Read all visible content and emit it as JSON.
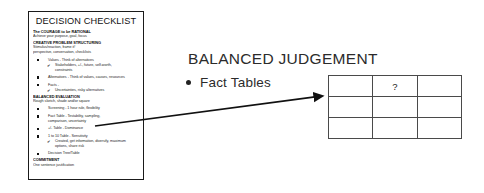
{
  "slide": {
    "background_color": "#ffffff",
    "ink_color": "#1a1a1a"
  },
  "checklist": {
    "title": "DECISION CHECKLIST",
    "sections": [
      {
        "heading": "The COURAGE to be RATIONAL",
        "subtitle": "Achieve your purpose, goal, focus"
      },
      {
        "heading": "CREATIVE PROBLEM STRUCTURING",
        "subtitle": "Stimulus/reaction, frame it!",
        "subtitle2": "perspective, conversation, checklists"
      }
    ],
    "bullets": [
      {
        "marker": "square",
        "text": "Values - Think of alternatives"
      },
      {
        "marker": "check",
        "text": "Stakeholders, +/-, future, self-worth,"
      },
      {
        "marker": "cont-deep",
        "text": "constraints"
      },
      {
        "marker": "square",
        "text": "Alternatives - Think of values, causes, resources"
      },
      {
        "marker": "square",
        "text": "Facts -"
      },
      {
        "marker": "check",
        "text": "Uncertainties, risky alternatives"
      }
    ],
    "section2": {
      "heading": "BALANCED EVALUATION",
      "subtitle": "Rough sketch, shade and/or square"
    },
    "bullets2": [
      {
        "marker": "square",
        "text": "Screening - 1 hour rule, flexibility"
      },
      {
        "marker": "square",
        "text": "Fact Table - Testability, sampling,"
      },
      {
        "marker": "cont",
        "text": "comparison, uncertainty"
      },
      {
        "marker": "square",
        "text": "+/- Table - Dominance"
      },
      {
        "marker": "square",
        "text": "1 to 10 Table - Sensitivity"
      },
      {
        "marker": "check",
        "text": "Created, get information, diversify, maximum"
      },
      {
        "marker": "cont-deep",
        "text": "options, share risk"
      },
      {
        "marker": "square",
        "text": "Decision Tree/Table"
      }
    ],
    "section3": {
      "heading": "COMMITMENT",
      "subtitle": "One sentence justification"
    }
  },
  "main": {
    "section_title": "BALANCED JUDGEMENT",
    "bullet": {
      "marker": "bullet-dot",
      "label": "Fact Tables"
    }
  },
  "fact_table": {
    "rows": 3,
    "columns": 3,
    "cells": [
      [
        "",
        "?",
        ""
      ],
      [
        "",
        "",
        ""
      ],
      [
        "",
        "",
        ""
      ]
    ]
  },
  "arrow": {
    "name": "pointer-arrow",
    "from_x": 95,
    "from_y": 126,
    "to_x": 322,
    "to_y": 96
  }
}
